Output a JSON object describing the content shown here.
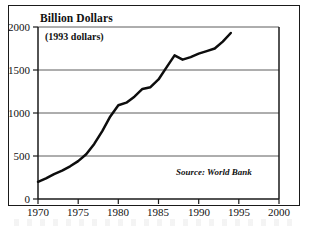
{
  "figure": {
    "axis_title": "Billion Dollars",
    "units_note": "(1993 dollars)",
    "source_note": "Source: World Bank"
  },
  "chart_data": {
    "type": "line",
    "title": "Billion Dollars",
    "subtitle": "(1993 dollars)",
    "xlabel": "",
    "ylabel": "Billion Dollars",
    "units": "Billions of 1993 U.S. dollars",
    "annotation": "Source: World Bank",
    "grid": true,
    "legend": "none",
    "xlim": [
      1970,
      2000
    ],
    "ylim": [
      0,
      2000
    ],
    "xticks": [
      1970,
      1975,
      1980,
      1985,
      1990,
      1995,
      2000
    ],
    "yticks": [
      0,
      500,
      1000,
      1500,
      2000
    ],
    "xtick_labels": [
      "1970",
      "1975",
      "1980",
      "1985",
      "1990",
      "1995",
      "2000"
    ],
    "ytick_labels": [
      "0",
      "500",
      "1000",
      "1500",
      "2000"
    ],
    "x": [
      1970,
      1971,
      1972,
      1973,
      1974,
      1975,
      1976,
      1977,
      1978,
      1979,
      1980,
      1981,
      1982,
      1983,
      1984,
      1985,
      1986,
      1987,
      1988,
      1989,
      1990,
      1991,
      1992,
      1993,
      1994
    ],
    "values": [
      200,
      240,
      290,
      330,
      380,
      440,
      520,
      640,
      790,
      960,
      1090,
      1120,
      1190,
      1280,
      1300,
      1390,
      1530,
      1670,
      1620,
      1650,
      1690,
      1720,
      1750,
      1830,
      1930
    ],
    "series": [
      {
        "name": "Developing country external debt",
        "values": [
          200,
          240,
          290,
          330,
          380,
          440,
          520,
          640,
          790,
          960,
          1090,
          1120,
          1190,
          1280,
          1300,
          1390,
          1530,
          1670,
          1620,
          1650,
          1690,
          1720,
          1750,
          1830,
          1930
        ]
      }
    ]
  }
}
